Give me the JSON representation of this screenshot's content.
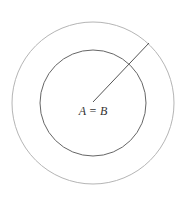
{
  "diagram": {
    "label": "A = B",
    "outer_circle": {
      "cx": 93,
      "cy": 103,
      "r": 81,
      "stroke": "#b5b5b5"
    },
    "inner_circle": {
      "cx": 93,
      "cy": 103,
      "r": 53,
      "stroke": "#666666"
    },
    "radius_line": {
      "x1": 93,
      "y1": 102,
      "x2": 149,
      "y2": 43,
      "stroke": "#555555"
    }
  }
}
